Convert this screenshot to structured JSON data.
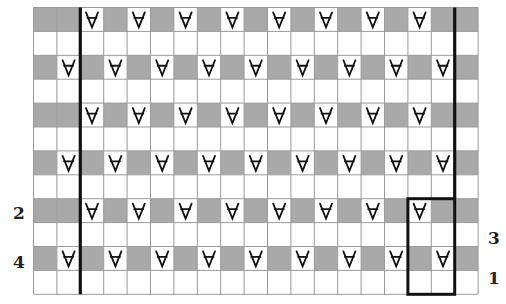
{
  "chart_data": {
    "type": "knitting-chart",
    "grid": {
      "rows": 12,
      "cols": 19,
      "origin_x": 33.5,
      "origin_y": 7.5,
      "cell_w": 23.4,
      "cell_h": 23.9
    },
    "colors": {
      "shaded": "#a9a9a9",
      "plain": "#ffffff",
      "gridline": "#9a9a9a",
      "bold": "#111111",
      "symbol": "#111111"
    },
    "symbol": "slip-stitch",
    "rows_pattern": [
      {
        "row": 0,
        "shaded": true,
        "slip_cols": [
          2,
          4,
          6,
          8,
          10,
          12,
          14,
          16
        ]
      },
      {
        "row": 1,
        "shaded": false,
        "slip_cols": []
      },
      {
        "row": 2,
        "shaded": true,
        "slip_cols": [
          1,
          3,
          5,
          7,
          9,
          11,
          13,
          15,
          17
        ]
      },
      {
        "row": 3,
        "shaded": false,
        "slip_cols": []
      },
      {
        "row": 4,
        "shaded": true,
        "slip_cols": [
          2,
          4,
          6,
          8,
          10,
          12,
          14,
          16
        ]
      },
      {
        "row": 5,
        "shaded": false,
        "slip_cols": []
      },
      {
        "row": 6,
        "shaded": true,
        "slip_cols": [
          1,
          3,
          5,
          7,
          9,
          11,
          13,
          15,
          17
        ]
      },
      {
        "row": 7,
        "shaded": false,
        "slip_cols": []
      },
      {
        "row": 8,
        "shaded": true,
        "slip_cols": [
          2,
          4,
          6,
          8,
          10,
          12,
          14,
          16
        ]
      },
      {
        "row": 9,
        "shaded": false,
        "slip_cols": []
      },
      {
        "row": 10,
        "shaded": true,
        "slip_cols": [
          1,
          3,
          5,
          7,
          9,
          11,
          13,
          15,
          17
        ]
      },
      {
        "row": 11,
        "shaded": false,
        "slip_cols": []
      }
    ],
    "bold_vertical_lines": [
      {
        "col_boundary": 2,
        "from_row": 0,
        "to_row": 12
      },
      {
        "col_boundary": 18,
        "from_row": 0,
        "to_row": 8
      }
    ],
    "repeat_box": {
      "col_from": 16,
      "col_to": 18,
      "row_from": 8,
      "row_to": 12
    },
    "row_labels": [
      {
        "text": "2",
        "side": "left",
        "x": 19,
        "y": 213
      },
      {
        "text": "4",
        "side": "left",
        "x": 19,
        "y": 262
      },
      {
        "text": "3",
        "side": "right",
        "x": 494,
        "y": 238
      },
      {
        "text": "1",
        "side": "right",
        "x": 494,
        "y": 278
      }
    ]
  }
}
